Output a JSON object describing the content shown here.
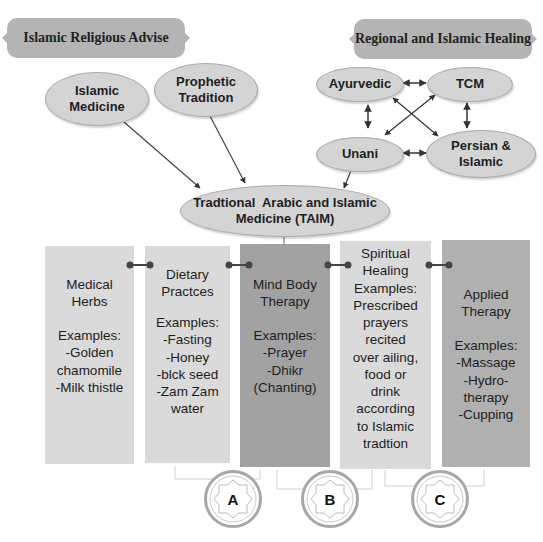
{
  "banners": {
    "left": "Islamic Religious Advise",
    "right": "Regional and Islamic Healing"
  },
  "sources": {
    "islamic_medicine": "Islamic Medicine",
    "prophetic_tradition": "Prophetic Tradition"
  },
  "regional": {
    "ayurvedic": "Ayurvedic",
    "tcm": "TCM",
    "unani": "Unani",
    "persian_islamic": "Persian & Islamic"
  },
  "center": {
    "line1": "Tradtional  Arabic and Islamic",
    "line2": "Medicine (TAIM)"
  },
  "categories": [
    {
      "title": [
        "Medical",
        "Herbs"
      ],
      "examples_label": "Examples:",
      "examples": [
        "-Golden",
        "chamomile",
        "-Milk thistle"
      ]
    },
    {
      "title": [
        "Dietary",
        "Practces"
      ],
      "examples_label": "Examples:",
      "examples": [
        "-Fasting",
        "-Honey",
        "-blck seed",
        "-Zam Zam",
        "water"
      ]
    },
    {
      "title": [
        "Mind Body",
        "Therapy"
      ],
      "examples_label": "Examples:",
      "examples": [
        "-Prayer",
        "-Dhikr",
        "(Chanting)"
      ]
    },
    {
      "title": [
        "Spiritual",
        "Healing"
      ],
      "examples_label": "Examples:",
      "examples": [
        "Prescribed",
        "prayers",
        "recited",
        "over ailing,",
        "food or",
        "drink",
        "according",
        "to Islamic",
        "tradtion"
      ]
    },
    {
      "title": [
        "Applied",
        "Therapy"
      ],
      "examples_label": "Examples:",
      "examples": [
        "-Massage",
        "-Hydro-",
        "therapy",
        "-Cupping"
      ]
    }
  ],
  "badges": [
    "A",
    "B",
    "C"
  ],
  "colors": {
    "banner": "#b4b4b4",
    "oval": "#d4d4d4",
    "box_light": "#dadada",
    "box_dark": "#a2a2a2",
    "box_mid": "#b0b0b0",
    "connector": "#444444"
  }
}
